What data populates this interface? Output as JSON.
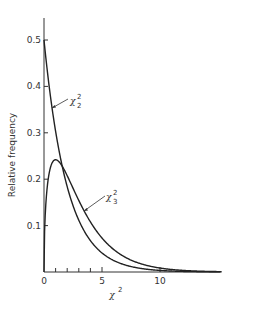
{
  "chart_data": {
    "type": "line",
    "title": "",
    "xlabel": "χ²",
    "ylabel": "Relative frequency",
    "xlim": [
      0,
      15
    ],
    "ylim": [
      0,
      0.5
    ],
    "grid": false,
    "legend": "inline annotations with arrows",
    "x_ticks": [
      "0",
      "5",
      "10"
    ],
    "x_minor_ticks": [
      1,
      2,
      3,
      4
    ],
    "y_ticks": [
      "0.1",
      "0.2",
      "0.3",
      "0.4",
      "0.5"
    ],
    "series": [
      {
        "name": "χ²₂",
        "df": 2,
        "x": [
          0,
          0.5,
          1,
          1.5,
          2,
          3,
          4,
          5,
          6,
          7,
          8,
          9,
          10,
          12,
          15
        ],
        "values": [
          0.5,
          0.389,
          0.303,
          0.236,
          0.184,
          0.112,
          0.068,
          0.041,
          0.025,
          0.015,
          0.009,
          0.006,
          0.003,
          0.001,
          0.0003
        ]
      },
      {
        "name": "χ²₃",
        "df": 3,
        "x": [
          0,
          0.25,
          0.5,
          1,
          1.5,
          2,
          3,
          4,
          5,
          6,
          7,
          8,
          9,
          10,
          12,
          15
        ],
        "values": [
          0,
          0.176,
          0.22,
          0.242,
          0.231,
          0.208,
          0.154,
          0.108,
          0.073,
          0.048,
          0.032,
          0.021,
          0.013,
          0.008,
          0.003,
          0.0007
        ]
      }
    ],
    "annotations": [
      {
        "label": "χ",
        "sup": "2",
        "sub": "2",
        "target": "χ²₂"
      },
      {
        "label": "χ",
        "sup": "2",
        "sub": "3",
        "target": "χ²₃"
      }
    ]
  }
}
